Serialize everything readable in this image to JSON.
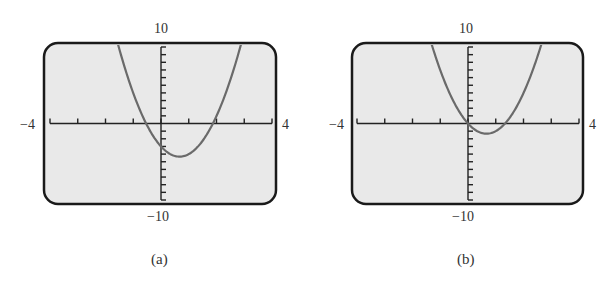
{
  "colors": {
    "frame": "#1a1a1a",
    "screen_bg": "#e9e9e9",
    "axis": "#222222",
    "curve": "#6a6a6a",
    "text": "#333333"
  },
  "chart_data": [
    {
      "type": "line",
      "panel_label": "(a)",
      "title": "",
      "xlabel": "",
      "ylabel": "",
      "xlim": [
        -4,
        4
      ],
      "ylim": [
        -10,
        10
      ],
      "x_tick_step": 1,
      "y_tick_step": 1,
      "grid": false,
      "window_labels": {
        "xmin": "−4",
        "xmax": "4",
        "ymin": "−10",
        "ymax": "10"
      },
      "series": [
        {
          "name": "f(x) = 3x² − 4x − 3 (estimated)",
          "x": [
            -1.6,
            -1.2,
            -0.8,
            -0.53,
            0,
            0.4,
            0.667,
            1.0,
            1.4,
            1.87,
            2.2,
            2.65
          ],
          "values": [
            10.1,
            6.1,
            1.1,
            0.0,
            -3.0,
            -4.1,
            -4.33,
            -4.0,
            -2.7,
            0.0,
            2.7,
            7.5
          ]
        }
      ],
      "annotations": {
        "vertex": [
          0.667,
          -4.33
        ],
        "x_intercepts": [
          -0.53,
          1.87
        ],
        "y_intercept": -3
      }
    },
    {
      "type": "line",
      "panel_label": "(b)",
      "title": "",
      "xlabel": "",
      "ylabel": "",
      "xlim": [
        -4,
        4
      ],
      "ylim": [
        -10,
        10
      ],
      "x_tick_step": 1,
      "y_tick_step": 1,
      "grid": false,
      "window_labels": {
        "xmin": "−4",
        "xmax": "4",
        "ymin": "−10",
        "ymax": "10"
      },
      "series": [
        {
          "name": "g(x) = 3x² − 4x (estimated)",
          "x": [
            -1.3,
            -1.0,
            -0.5,
            0,
            0.4,
            0.667,
            1.0,
            1.33,
            1.8,
            2.3
          ],
          "values": [
            10.3,
            7.0,
            2.75,
            0.0,
            -1.12,
            -1.33,
            -1.0,
            0.0,
            2.5,
            6.7
          ]
        }
      ],
      "annotations": {
        "vertex": [
          0.667,
          -1.33
        ],
        "x_intercepts": [
          0,
          1.33
        ],
        "y_intercept": 0
      }
    }
  ],
  "panels": [
    {
      "caption": "(a)",
      "ymax_label": "10",
      "ymin_label": "−10",
      "xmin_label": "−4",
      "xmax_label": "4"
    },
    {
      "caption": "(b)",
      "ymax_label": "10",
      "ymin_label": "−10",
      "xmin_label": "−4",
      "xmax_label": "4"
    }
  ]
}
